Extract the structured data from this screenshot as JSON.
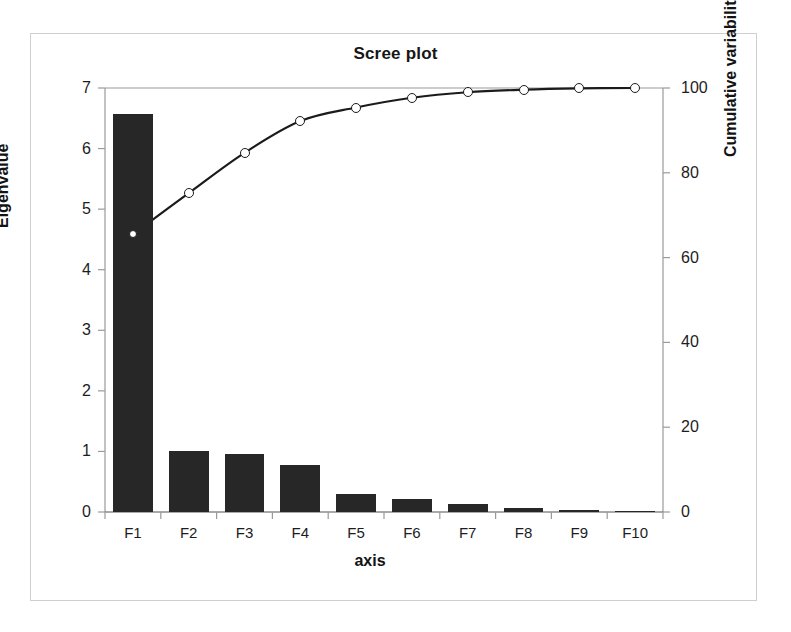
{
  "chart_data": {
    "type": "bar",
    "title": "Scree plot",
    "xlabel": "axis",
    "ylabel": "Eigenvalue",
    "y2label": "Cumulative variability (%)",
    "categories": [
      "F1",
      "F2",
      "F3",
      "F4",
      "F5",
      "F6",
      "F7",
      "F8",
      "F9",
      "F10"
    ],
    "series": [
      {
        "name": "Eigenvalue",
        "type": "bar",
        "axis": "left",
        "color": "#272727",
        "values": [
          6.57,
          1.0,
          0.95,
          0.77,
          0.3,
          0.22,
          0.13,
          0.06,
          0.03,
          0.01
        ]
      },
      {
        "name": "Cumulative variability (%)",
        "type": "line",
        "axis": "right",
        "color": "#1b1b1b",
        "marker": "open-circle",
        "values": [
          65.5,
          75.2,
          84.7,
          92.2,
          95.4,
          97.7,
          99.0,
          99.6,
          99.9,
          100.0
        ]
      }
    ],
    "ylim": [
      0,
      7
    ],
    "yticks": [
      0,
      1,
      2,
      3,
      4,
      5,
      6,
      7
    ],
    "ytick_labels": [
      "0",
      "1",
      "2",
      "3",
      "4",
      "5",
      "6",
      "7"
    ],
    "y2lim": [
      0,
      100
    ],
    "y2ticks": [
      0,
      20,
      40,
      60,
      80,
      100
    ],
    "y2tick_labels": [
      "0",
      "20",
      "40",
      "60",
      "80",
      "100"
    ],
    "grid": false,
    "legend": "none"
  },
  "figure": {
    "border_color": "#cfcfcf",
    "background": "#ffffff"
  }
}
